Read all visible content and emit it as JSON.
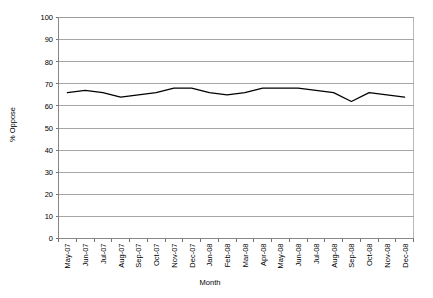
{
  "chart_data": {
    "type": "line",
    "title": "",
    "xlabel": "Month",
    "ylabel": "% Oppose",
    "ylim": [
      0,
      100
    ],
    "ytick_step": 10,
    "yticks": [
      0,
      10,
      20,
      30,
      40,
      50,
      60,
      70,
      80,
      90,
      100
    ],
    "grid": true,
    "legend": "none",
    "line_color": "#000000",
    "categories": [
      "May-07",
      "Jun-07",
      "Jul-07",
      "Aug-07",
      "Sep-07",
      "Oct-07",
      "Nov-07",
      "Dec-07",
      "Jan-08",
      "Feb-08",
      "Mar-08",
      "Apr-08",
      "May-08",
      "Jun-08",
      "Jul-08",
      "Aug-08",
      "Sep-08",
      "Oct-08",
      "Nov-08",
      "Dec-08"
    ],
    "series": [
      {
        "name": "% Oppose",
        "values": [
          66,
          67,
          66,
          64,
          65,
          66,
          68,
          68,
          66,
          65,
          66,
          68,
          68,
          68,
          67,
          66,
          62,
          66,
          65,
          64
        ]
      }
    ]
  },
  "axes": {
    "y_title": "% Oppose",
    "x_title": "Month"
  }
}
